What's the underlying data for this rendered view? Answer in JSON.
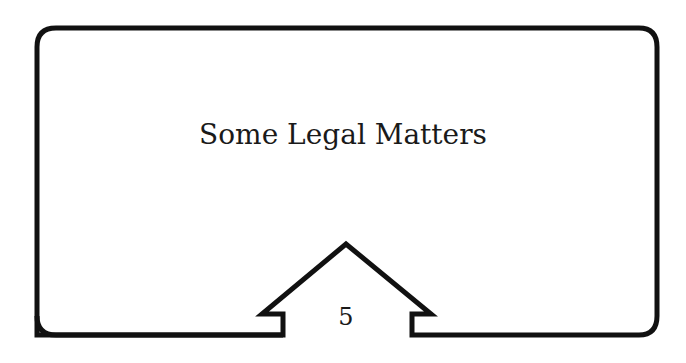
{
  "page": {
    "title": "Some Legal Matters",
    "page_number": "5"
  },
  "colors": {
    "stroke": "#111111",
    "background": "#ffffff"
  }
}
